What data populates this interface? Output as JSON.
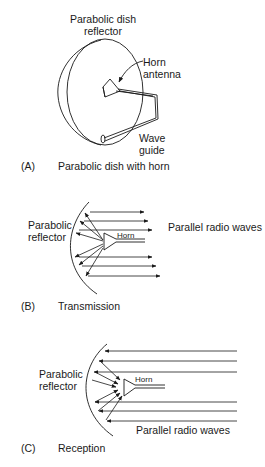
{
  "panel_a": {
    "label": "(A)",
    "caption": "Parabolic dish with horn",
    "dish_label_line1": "Parabolic dish",
    "dish_label_line2": "reflector",
    "horn_label_line1": "Horn",
    "horn_label_line2": "antenna",
    "waveguide_label_line1": "Wave",
    "waveguide_label_line2": "guide"
  },
  "panel_b": {
    "label": "(B)",
    "caption": "Transmission",
    "reflector_label_line1": "Parabolic",
    "reflector_label_line2": "reflector",
    "horn_label": "Horn",
    "waves_label": "Parallel radio waves"
  },
  "panel_c": {
    "label": "(C)",
    "caption": "Reception",
    "reflector_label_line1": "Parabolic",
    "reflector_label_line2": "reflector",
    "horn_label": "Horn",
    "waves_label": "Parallel radio waves"
  },
  "colors": {
    "stroke": "#1a1a1a",
    "background": "#ffffff"
  }
}
